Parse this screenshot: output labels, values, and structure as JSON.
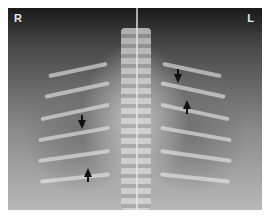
{
  "image": {
    "type": "chest-radiograph",
    "labels": {
      "right": "R",
      "left": "L"
    },
    "arrows": [
      {
        "x": 82,
        "y": 112,
        "direction": "down"
      },
      {
        "x": 88,
        "y": 172,
        "direction": "up"
      },
      {
        "x": 174,
        "y": 68,
        "direction": "down"
      },
      {
        "x": 187,
        "y": 102,
        "direction": "up"
      }
    ]
  }
}
